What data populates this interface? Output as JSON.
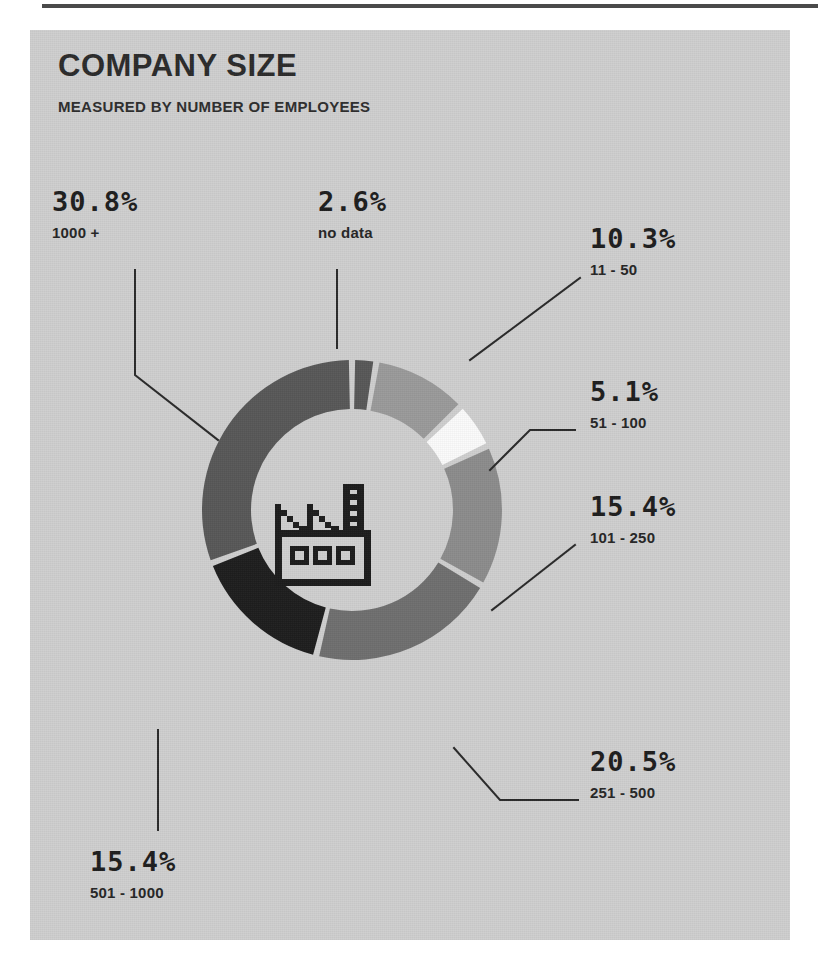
{
  "page": {
    "background": "#ffffff",
    "panel_color": "#cfcfcf"
  },
  "header": {
    "title": "COMPANY SIZE",
    "subtitle": "MEASURED BY NUMBER OF EMPLOYEES"
  },
  "center_icon": {
    "name": "factory-icon",
    "color": "#1d1d1d"
  },
  "chart_data": {
    "type": "pie",
    "variant": "donut",
    "title": "COMPANY SIZE",
    "subtitle": "MEASURED BY NUMBER OF EMPLOYEES",
    "unit": "%",
    "categories": [
      "no data",
      "11 - 50",
      "51 - 100",
      "101 - 250",
      "251 - 500",
      "501 - 1000",
      "1000 +"
    ],
    "values": [
      2.6,
      10.3,
      5.1,
      15.4,
      20.5,
      15.4,
      30.8
    ],
    "colors": [
      "#585858",
      "#9a9a9a",
      "#fbfbfb",
      "#8c8c8c",
      "#6f6f6f",
      "#1e1e1e",
      "#585858"
    ],
    "start_angle_deg": 0,
    "legend": "callout-labels",
    "grid": false
  },
  "labels": [
    {
      "pct": "30.8%",
      "range": "1000 +"
    },
    {
      "pct": "2.6%",
      "range": "no data"
    },
    {
      "pct": "10.3%",
      "range": "11 - 50"
    },
    {
      "pct": "5.1%",
      "range": "51 - 100"
    },
    {
      "pct": "15.4%",
      "range": "101 - 250"
    },
    {
      "pct": "20.5%",
      "range": "251 - 500"
    },
    {
      "pct": "15.4%",
      "range": "501 - 1000"
    }
  ]
}
